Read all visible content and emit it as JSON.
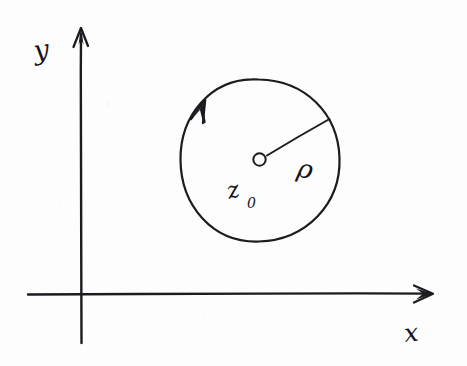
{
  "figure": {
    "kind": "hand-drawn-math-diagram",
    "background_color": "#fdfdfd",
    "ink_color": "#1b1b20"
  },
  "axes": {
    "x_label": "x",
    "y_label": "y",
    "origin": {
      "x": 80,
      "y": 294
    },
    "x_axis": {
      "start_x": 28,
      "end_x": 433,
      "y": 294,
      "arrow": "right"
    },
    "y_axis": {
      "x": 81,
      "top_y": 28,
      "bottom_y": 343,
      "arrow": "up"
    },
    "x_label_pos": {
      "x": 411,
      "y": 336
    },
    "y_label_pos": {
      "x": 35,
      "y": 55
    }
  },
  "contour": {
    "shape": "circle",
    "center": {
      "x": 260,
      "y": 160
    },
    "radius": 80,
    "orientation": "counterclockwise",
    "orientation_arrow_angle_deg": 133,
    "center_marker": "open-circle"
  },
  "radius_marker": {
    "label": "ρ",
    "label_pos": {
      "x": 300,
      "y": 170
    },
    "from": {
      "x": 260,
      "y": 160
    },
    "to": {
      "x": 329,
      "y": 120
    },
    "angle_deg": 30
  },
  "center_label": {
    "symbol": "z",
    "subscript": "0",
    "pos": {
      "x": 234,
      "y": 200
    }
  }
}
